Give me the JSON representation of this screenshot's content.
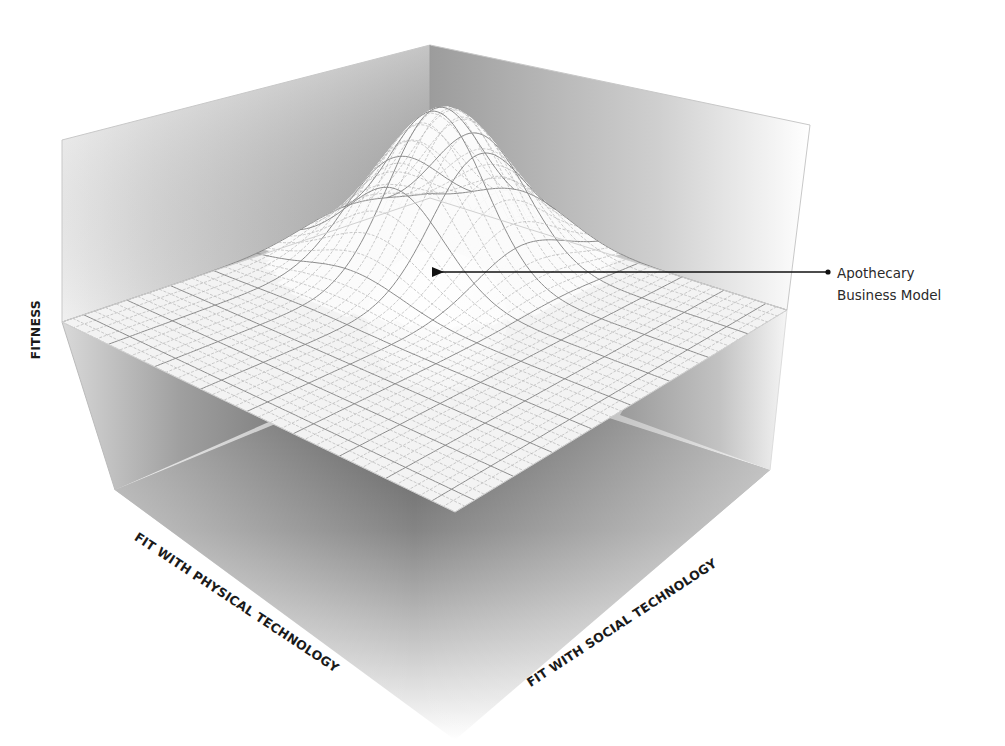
{
  "diagram": {
    "type": "3d fitness landscape",
    "axes": {
      "vertical": "FITNESS",
      "left_horizontal": "FIT WITH PHYSICAL TECHNOLOGY",
      "right_horizontal": "FIT WITH SOCIAL TECHNOLOGY"
    },
    "annotation": {
      "line1": "Apothecary",
      "line2": "Business Model",
      "target": "peak"
    },
    "surface": {
      "shape": "single gaussian peak on flat plane",
      "grid_lines": 34
    },
    "colors": {
      "background": "#ffffff",
      "wall_dark": "#6e6e6e",
      "wall_light": "#f4f4f4",
      "surface": "#fafafa",
      "grid": "#9a9a9a",
      "text": "#1a1a1a",
      "arrow": "#111111"
    }
  }
}
